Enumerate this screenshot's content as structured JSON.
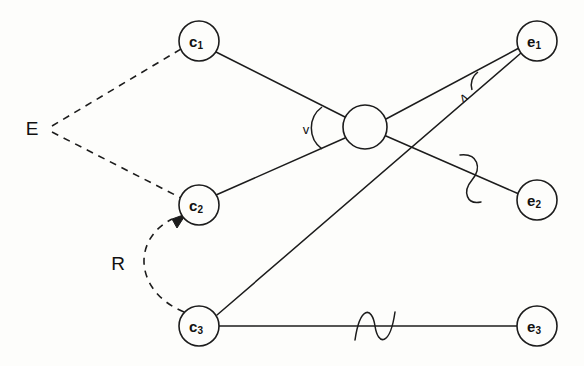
{
  "figure": {
    "background_color": "#fdfdfb",
    "ink_color": "#1c1c1c",
    "width": 584,
    "height": 366
  },
  "nodes": [
    {
      "id": "c1",
      "base": "c",
      "subscript": "1",
      "cx": 199,
      "cy": 41,
      "r": 20,
      "group": "cause"
    },
    {
      "id": "c2",
      "base": "c",
      "subscript": "2",
      "cx": 199,
      "cy": 205,
      "r": 20,
      "group": "cause"
    },
    {
      "id": "c3",
      "base": "c",
      "subscript": "3",
      "cx": 199,
      "cy": 326,
      "r": 20,
      "group": "cause"
    },
    {
      "id": "e1",
      "base": "e",
      "subscript": "1",
      "cx": 537,
      "cy": 41,
      "r": 20,
      "group": "effect"
    },
    {
      "id": "e2",
      "base": "e",
      "subscript": "2",
      "cx": 537,
      "cy": 200,
      "r": 20,
      "group": "effect"
    },
    {
      "id": "e3",
      "base": "e",
      "subscript": "3",
      "cx": 537,
      "cy": 326,
      "r": 20,
      "group": "effect"
    }
  ],
  "hub": {
    "id": "hub",
    "cx": 365,
    "cy": 127,
    "r": 22,
    "label": ""
  },
  "set_labels": [
    {
      "id": "E",
      "text": "E",
      "x": 32,
      "y": 128
    },
    {
      "id": "R",
      "text": "R",
      "x": 118,
      "y": 263
    }
  ],
  "angle_labels": [
    {
      "id": "v-angle",
      "text": "v",
      "x": 306,
      "y": 129
    },
    {
      "id": "lambda-angle",
      "text": "ʌ",
      "x": 463,
      "y": 97
    }
  ],
  "edges": [
    {
      "id": "E-c1",
      "from": "E",
      "to": "c1",
      "style": "dashed",
      "arrow": false
    },
    {
      "id": "E-c2",
      "from": "E",
      "to": "c2",
      "style": "dashed",
      "arrow": false
    },
    {
      "id": "R-c3-c2",
      "from": "c3",
      "to": "c2",
      "style": "dashed-curve",
      "arrow": true
    },
    {
      "id": "c1-hub",
      "from": "c1",
      "to": "hub",
      "style": "solid",
      "arrow": false
    },
    {
      "id": "c2-hub",
      "from": "c2",
      "to": "hub",
      "style": "solid",
      "arrow": false
    },
    {
      "id": "hub-e1",
      "from": "hub",
      "to": "e1",
      "style": "solid",
      "arrow": false
    },
    {
      "id": "hub-e2",
      "from": "hub",
      "to": "e2",
      "style": "solid",
      "arrow": false,
      "marker": "squiggle"
    },
    {
      "id": "c3-e1",
      "from": "c3",
      "to": "e1",
      "style": "solid",
      "arrow": false
    },
    {
      "id": "c3-e3",
      "from": "c3",
      "to": "e3",
      "style": "solid",
      "arrow": false,
      "marker": "squiggle"
    }
  ],
  "markers": {
    "squiggle_hub_e2": {
      "cx": 470,
      "cy": 177,
      "orientation": "vertical"
    },
    "squiggle_c3_e3": {
      "cx": 375,
      "cy": 326,
      "orientation": "horizontal"
    }
  }
}
